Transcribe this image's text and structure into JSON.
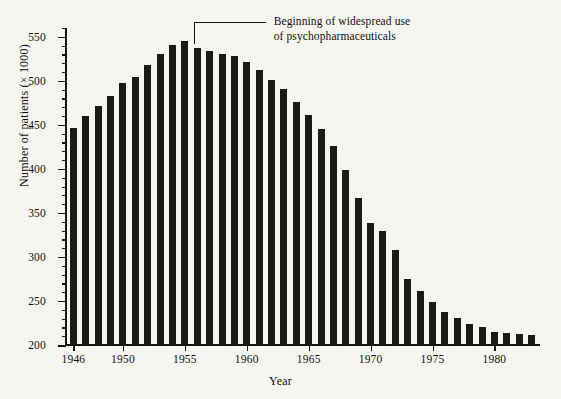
{
  "chart_data": {
    "type": "bar",
    "title": "",
    "xlabel": "Year",
    "ylabel": "Number of patients (× 1000)",
    "ylim": [
      200,
      560
    ],
    "xlim": [
      1945.4,
      1983.6
    ],
    "grid": false,
    "legend": null,
    "y_major_ticks": [
      200,
      250,
      300,
      350,
      400,
      450,
      500,
      550
    ],
    "y_tick_labels": [
      "200",
      "250",
      "300",
      "350",
      "400",
      "450",
      "500",
      "550"
    ],
    "y_minor_tick_step": 10,
    "x_tick_years": [
      1946,
      1950,
      1955,
      1960,
      1965,
      1970,
      1975,
      1980
    ],
    "x_tick_labels": [
      "1946",
      "1950",
      "1955",
      "1960",
      "1965",
      "1970",
      "1975",
      "1980"
    ],
    "bar_color": "#1c1a17",
    "background_color": "#f7f5f0",
    "axis_color": "#17140f",
    "categories": [
      1946,
      1947,
      1948,
      1949,
      1950,
      1951,
      1952,
      1953,
      1954,
      1955,
      1956,
      1957,
      1958,
      1959,
      1960,
      1961,
      1962,
      1963,
      1964,
      1965,
      1966,
      1967,
      1968,
      1969,
      1970,
      1971,
      1972,
      1973,
      1974,
      1975,
      1976,
      1977,
      1978,
      1979,
      1980,
      1981,
      1982,
      1983
    ],
    "values": [
      447,
      460,
      472,
      483,
      497,
      504,
      518,
      530,
      541,
      545,
      537,
      534,
      531,
      528,
      521,
      512,
      501,
      491,
      476,
      461,
      445,
      426,
      399,
      367,
      339,
      330,
      308,
      275,
      261,
      249,
      237,
      231,
      224,
      220,
      215,
      214,
      212,
      211
    ],
    "annotations": [
      {
        "text_lines": [
          "Beginning of widespread use",
          "of psychopharmaceuticals"
        ],
        "points_to_year": 1956
      }
    ]
  }
}
